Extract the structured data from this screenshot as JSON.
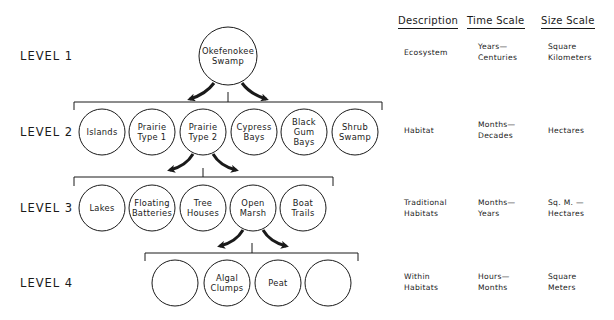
{
  "levels": [
    {
      "label": "LEVEL 1",
      "description": "Ecosystem",
      "time_scale": "Years—\nCenturies",
      "size_scale": "Square\nKilometers"
    },
    {
      "label": "LEVEL 2",
      "description": "Habitat",
      "time_scale": "Months—\nDecades",
      "size_scale": "Hectares"
    },
    {
      "label": "LEVEL 3",
      "description": "Traditional\nHabitats",
      "time_scale": "Months—\nYears",
      "size_scale": "Sq. M. —\nHectares"
    },
    {
      "label": "LEVEL 4",
      "description": "Within\nHabitats",
      "time_scale": "Hours—\nMonths",
      "size_scale": "Square\nMeters"
    }
  ],
  "headers": {
    "description": "Description",
    "time_scale": "Time Scale",
    "size_scale": "Size Scale"
  },
  "nodes": {
    "level1": [
      "Okefenokee Swamp"
    ],
    "level2": [
      "Islands",
      "Prairie Type 1",
      "Prairie Type 2",
      "Cypress Bays",
      "Black Gum Bays",
      "Shrub Swamp"
    ],
    "level3": [
      "Lakes",
      "Floating Batteries",
      "Tree Houses",
      "Open Marsh",
      "Boat Trails"
    ],
    "level4": [
      "",
      "Algal Clumps",
      "Peat",
      ""
    ]
  },
  "node_lines": {
    "l1_0": "Okefenokee\nSwamp",
    "l2_0": "Islands",
    "l2_1": "Prairie\nType 1",
    "l2_2": "Prairie\nType 2",
    "l2_3": "Cypress\nBays",
    "l2_4": "Black\nGum\nBays",
    "l2_5": "Shrub\nSwamp",
    "l3_0": "Lakes",
    "l3_1": "Floating\nBatteries",
    "l3_2": "Tree\nHouses",
    "l3_3": "Open\nMarsh",
    "l3_4": "Boat\nTrails",
    "l4_0": "",
    "l4_1": "Algal\nClumps",
    "l4_2": "Peat",
    "l4_3": ""
  },
  "colors": {
    "ink": "#1a1a1a",
    "background": "#ffffff"
  }
}
